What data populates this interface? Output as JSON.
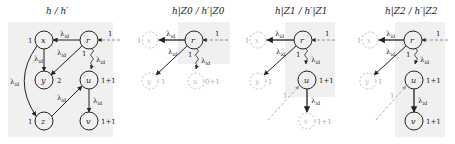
{
  "panels": [
    {
      "title": "h / h′",
      "nodes": [
        {
          "id": "x",
          "label": "x",
          "weight": "1"
        },
        {
          "id": "r",
          "label": "r",
          "weight": ""
        },
        {
          "id": "y",
          "label": "y",
          "weight": "2"
        },
        {
          "id": "u",
          "label": "u",
          "weight": "1+1"
        },
        {
          "id": "z",
          "label": "z",
          "weight": "1"
        },
        {
          "id": "v",
          "label": "v",
          "weight": "1+1"
        }
      ],
      "edges": [
        {
          "from": "r",
          "to": "x",
          "label": "λid"
        },
        {
          "from": "x",
          "to": "y",
          "label": "λid"
        },
        {
          "from": "r",
          "to": "y",
          "label": "λid"
        },
        {
          "from": "r",
          "to": "u",
          "label": "λid",
          "style": "wavy",
          "weight": "1"
        },
        {
          "from": "x",
          "to": "z",
          "label": "λid"
        },
        {
          "from": "z",
          "to": "u",
          "label": "λid"
        },
        {
          "from": "u",
          "to": "v",
          "label": "λid"
        },
        {
          "from": "external",
          "to": "r",
          "label": "1",
          "style": "dashed"
        }
      ]
    },
    {
      "title": "h|Z0 / h′|Z0",
      "nodes": [
        {
          "id": "x",
          "label": "x",
          "weight": "1",
          "faint": true
        },
        {
          "id": "r",
          "label": "r",
          "weight": ""
        },
        {
          "id": "y",
          "label": "y",
          "weight": "1",
          "faint": true
        },
        {
          "id": "u",
          "label": "u",
          "weight": "0+1",
          "faint": true
        }
      ],
      "edges": [
        {
          "from": "r",
          "to": "x",
          "label": "λid"
        },
        {
          "from": "r",
          "to": "y",
          "label": "λid"
        },
        {
          "from": "r",
          "to": "u",
          "label": "λid",
          "style": "wavy",
          "weight": "1"
        },
        {
          "from": "external",
          "to": "r",
          "label": "1",
          "style": "dashed"
        }
      ]
    },
    {
      "title": "h|Z1 / h′|Z1",
      "nodes": [
        {
          "id": "x",
          "label": "x",
          "weight": "1",
          "faint": true
        },
        {
          "id": "r",
          "label": "r",
          "weight": ""
        },
        {
          "id": "y",
          "label": "y",
          "weight": "1",
          "faint": true
        },
        {
          "id": "u",
          "label": "u",
          "weight": "1+1"
        },
        {
          "id": "v",
          "label": "v",
          "weight": "1+1",
          "faint": true
        }
      ],
      "edges": [
        {
          "from": "r",
          "to": "x",
          "label": "λid"
        },
        {
          "from": "r",
          "to": "y",
          "label": "λid"
        },
        {
          "from": "r",
          "to": "u",
          "label": "λid",
          "style": "wavy",
          "weight": "1"
        },
        {
          "from": "u",
          "to": "v",
          "label": "λid"
        },
        {
          "from": "external",
          "to": "r",
          "label": "1",
          "style": "dashed"
        },
        {
          "from": "external",
          "to": "u",
          "label": "1",
          "style": "dashed"
        }
      ]
    },
    {
      "title": "h|Z2 / h′|Z2",
      "nodes": [
        {
          "id": "x",
          "label": "x",
          "weight": "1",
          "faint": true
        },
        {
          "id": "r",
          "label": "r",
          "weight": ""
        },
        {
          "id": "y",
          "label": "y",
          "weight": "1",
          "faint": true
        },
        {
          "id": "u",
          "label": "u",
          "weight": "1+1"
        },
        {
          "id": "v",
          "label": "v",
          "weight": "1+1"
        }
      ],
      "edges": [
        {
          "from": "r",
          "to": "x",
          "label": "λid"
        },
        {
          "from": "r",
          "to": "y",
          "label": "λid"
        },
        {
          "from": "r",
          "to": "u",
          "label": "λid",
          "style": "wavy",
          "weight": "1"
        },
        {
          "from": "u",
          "to": "v",
          "label": "λid"
        },
        {
          "from": "external",
          "to": "r",
          "label": "1",
          "style": "dashed"
        },
        {
          "from": "external",
          "to": "u",
          "label": "1",
          "style": "dashed"
        }
      ]
    }
  ],
  "labels": {
    "lambda": "λ",
    "lambda_sub": "id",
    "one": "1"
  }
}
